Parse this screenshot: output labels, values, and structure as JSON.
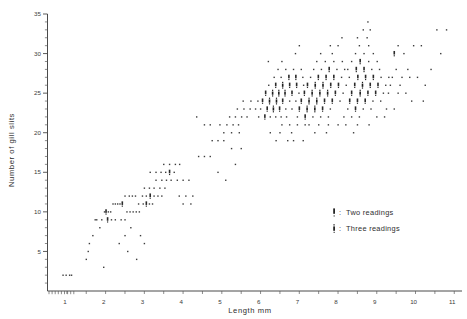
{
  "figure": {
    "background": "#ffffff",
    "ink": "#3a3a3a"
  },
  "chart_data": {
    "type": "scatter",
    "title": "",
    "xlabel": "Length  mm",
    "ylabel": "Number of gill slits",
    "xlim": [
      0.55,
      11.25
    ],
    "ylim": [
      0,
      35
    ],
    "grid": false,
    "xticks": [
      1,
      2,
      3,
      4,
      5,
      6,
      7,
      8,
      9,
      10,
      11
    ],
    "xticklabels": [
      "1",
      "2",
      "3",
      "4",
      "5",
      "6",
      "7",
      "8",
      "9",
      "10",
      "11"
    ],
    "yticks": [
      5,
      10,
      15,
      20,
      25,
      30,
      35
    ],
    "yticklabels": [
      "5",
      "10",
      "15",
      "20",
      "25",
      "30",
      "35"
    ],
    "x_minor_step": 0.5,
    "y_minor_step": 1,
    "legend": {
      "position": "inside-lower-right",
      "entries": [
        {
          "symbol": "two-readings-marker",
          "separator": ":",
          "label": "Two  readings"
        },
        {
          "symbol": "three-readings-marker",
          "separator": ":",
          "label": "Three  readings"
        }
      ]
    },
    "marker_weights": {
      "single": 1,
      "two": 2,
      "three": 3
    },
    "points": [
      [
        0.95,
        2,
        1
      ],
      [
        1.03,
        2,
        1
      ],
      [
        1.12,
        2,
        1
      ],
      [
        1.17,
        2,
        1
      ],
      [
        1.55,
        4,
        1
      ],
      [
        1.6,
        5,
        1
      ],
      [
        1.63,
        6,
        1
      ],
      [
        1.72,
        7,
        1
      ],
      [
        1.78,
        9,
        1
      ],
      [
        1.82,
        9,
        1
      ],
      [
        1.95,
        9,
        1
      ],
      [
        1.9,
        8,
        1
      ],
      [
        2.02,
        10,
        1
      ],
      [
        2.06,
        10,
        2
      ],
      [
        2.12,
        10,
        1
      ],
      [
        2.18,
        10,
        1
      ],
      [
        2.24,
        11,
        1
      ],
      [
        2.3,
        11,
        1
      ],
      [
        2.36,
        11,
        1
      ],
      [
        2.42,
        11,
        1
      ],
      [
        2.48,
        11,
        2
      ],
      [
        2.1,
        9,
        2
      ],
      [
        2.2,
        9,
        1
      ],
      [
        2.3,
        9,
        1
      ],
      [
        2.45,
        9,
        1
      ],
      [
        2.55,
        9,
        1
      ],
      [
        2.6,
        10,
        1
      ],
      [
        2.68,
        10,
        1
      ],
      [
        2.76,
        10,
        1
      ],
      [
        2.84,
        10,
        1
      ],
      [
        2.92,
        10,
        1
      ],
      [
        2.55,
        12,
        1
      ],
      [
        2.66,
        12,
        1
      ],
      [
        2.74,
        12,
        1
      ],
      [
        2.82,
        12,
        1
      ],
      [
        2.9,
        11,
        1
      ],
      [
        3.02,
        11,
        1
      ],
      [
        3.1,
        11,
        2
      ],
      [
        3.18,
        11,
        1
      ],
      [
        3.26,
        11,
        1
      ],
      [
        3.0,
        12,
        1
      ],
      [
        3.1,
        12,
        1
      ],
      [
        3.2,
        12,
        2
      ],
      [
        3.3,
        12,
        1
      ],
      [
        3.4,
        12,
        1
      ],
      [
        3.5,
        12,
        1
      ],
      [
        3.05,
        13,
        1
      ],
      [
        3.18,
        13,
        1
      ],
      [
        3.3,
        13,
        1
      ],
      [
        3.45,
        13,
        1
      ],
      [
        3.58,
        13,
        1
      ],
      [
        3.35,
        14,
        1
      ],
      [
        3.5,
        14,
        1
      ],
      [
        3.62,
        14,
        1
      ],
      [
        3.74,
        14,
        1
      ],
      [
        3.2,
        15,
        1
      ],
      [
        3.35,
        15,
        1
      ],
      [
        3.48,
        15,
        1
      ],
      [
        3.6,
        15,
        1
      ],
      [
        3.7,
        15,
        2
      ],
      [
        3.82,
        15,
        1
      ],
      [
        3.55,
        16,
        1
      ],
      [
        3.7,
        16,
        1
      ],
      [
        3.85,
        16,
        1
      ],
      [
        3.96,
        16,
        1
      ],
      [
        3.9,
        14,
        1
      ],
      [
        4.05,
        14,
        1
      ],
      [
        4.2,
        14,
        1
      ],
      [
        3.95,
        12,
        1
      ],
      [
        4.12,
        12,
        1
      ],
      [
        4.3,
        12,
        1
      ],
      [
        4.05,
        11,
        1
      ],
      [
        4.25,
        11,
        1
      ],
      [
        2.7,
        8,
        1
      ],
      [
        2.95,
        7,
        1
      ],
      [
        3.05,
        6,
        1
      ],
      [
        2.62,
        5,
        1
      ],
      [
        2.4,
        6,
        1
      ],
      [
        2.55,
        7,
        1
      ],
      [
        2.85,
        4,
        1
      ],
      [
        2.0,
        3,
        1
      ],
      [
        4.45,
        17,
        1
      ],
      [
        4.6,
        17,
        1
      ],
      [
        4.75,
        17,
        1
      ],
      [
        4.8,
        19,
        1
      ],
      [
        4.95,
        19,
        1
      ],
      [
        5.1,
        19,
        1
      ],
      [
        5.0,
        21,
        1
      ],
      [
        5.18,
        21,
        1
      ],
      [
        5.34,
        21,
        1
      ],
      [
        5.48,
        21,
        1
      ],
      [
        5.25,
        22,
        1
      ],
      [
        5.4,
        22,
        1
      ],
      [
        5.56,
        22,
        1
      ],
      [
        5.7,
        22,
        1
      ],
      [
        5.1,
        20,
        1
      ],
      [
        5.3,
        20,
        1
      ],
      [
        5.5,
        20,
        1
      ],
      [
        5.45,
        23,
        1
      ],
      [
        5.62,
        23,
        1
      ],
      [
        5.78,
        23,
        1
      ],
      [
        5.92,
        23,
        1
      ],
      [
        5.6,
        24,
        1
      ],
      [
        5.8,
        24,
        1
      ],
      [
        5.98,
        24,
        1
      ],
      [
        5.3,
        18,
        1
      ],
      [
        5.55,
        18,
        1
      ],
      [
        5.4,
        16,
        1
      ],
      [
        6.0,
        22,
        1
      ],
      [
        6.16,
        22,
        2
      ],
      [
        6.3,
        22,
        1
      ],
      [
        6.44,
        22,
        1
      ],
      [
        6.58,
        22,
        1
      ],
      [
        6.72,
        22,
        1
      ],
      [
        6.05,
        23,
        1
      ],
      [
        6.22,
        23,
        2
      ],
      [
        6.38,
        23,
        3
      ],
      [
        6.54,
        23,
        2
      ],
      [
        6.7,
        23,
        1
      ],
      [
        6.86,
        23,
        1
      ],
      [
        6.1,
        24,
        2
      ],
      [
        6.28,
        24,
        3
      ],
      [
        6.46,
        24,
        3
      ],
      [
        6.62,
        24,
        2
      ],
      [
        6.8,
        24,
        1
      ],
      [
        6.96,
        24,
        1
      ],
      [
        6.18,
        25,
        2
      ],
      [
        6.36,
        25,
        3
      ],
      [
        6.52,
        25,
        3
      ],
      [
        6.68,
        25,
        3
      ],
      [
        6.86,
        25,
        2
      ],
      [
        7.04,
        25,
        1
      ],
      [
        6.26,
        26,
        1
      ],
      [
        6.44,
        26,
        2
      ],
      [
        6.62,
        26,
        3
      ],
      [
        6.8,
        26,
        2
      ],
      [
        6.98,
        26,
        2
      ],
      [
        7.16,
        26,
        1
      ],
      [
        6.4,
        27,
        1
      ],
      [
        6.58,
        27,
        1
      ],
      [
        6.78,
        27,
        2
      ],
      [
        6.96,
        27,
        2
      ],
      [
        7.14,
        27,
        1
      ],
      [
        6.5,
        28,
        1
      ],
      [
        6.7,
        28,
        1
      ],
      [
        6.9,
        28,
        1
      ],
      [
        7.1,
        28,
        1
      ],
      [
        6.6,
        21,
        1
      ],
      [
        6.8,
        21,
        1
      ],
      [
        7.0,
        21,
        1
      ],
      [
        7.2,
        21,
        1
      ],
      [
        6.3,
        20,
        1
      ],
      [
        6.55,
        20,
        1
      ],
      [
        6.85,
        20,
        1
      ],
      [
        6.45,
        19,
        1
      ],
      [
        6.9,
        19,
        1
      ],
      [
        6.25,
        29,
        1
      ],
      [
        6.6,
        29,
        1
      ],
      [
        7.0,
        22,
        1
      ],
      [
        7.2,
        22,
        2
      ],
      [
        7.4,
        22,
        1
      ],
      [
        7.6,
        22,
        1
      ],
      [
        7.8,
        22,
        1
      ],
      [
        7.05,
        23,
        2
      ],
      [
        7.25,
        23,
        3
      ],
      [
        7.45,
        23,
        3
      ],
      [
        7.65,
        23,
        2
      ],
      [
        7.85,
        23,
        1
      ],
      [
        7.1,
        24,
        2
      ],
      [
        7.3,
        24,
        3
      ],
      [
        7.5,
        24,
        3
      ],
      [
        7.7,
        24,
        2
      ],
      [
        7.9,
        24,
        2
      ],
      [
        8.1,
        24,
        1
      ],
      [
        7.18,
        25,
        2
      ],
      [
        7.38,
        25,
        3
      ],
      [
        7.58,
        25,
        3
      ],
      [
        7.78,
        25,
        3
      ],
      [
        7.98,
        25,
        2
      ],
      [
        8.18,
        25,
        1
      ],
      [
        7.26,
        26,
        2
      ],
      [
        7.46,
        26,
        3
      ],
      [
        7.66,
        26,
        3
      ],
      [
        7.86,
        26,
        2
      ],
      [
        8.06,
        26,
        2
      ],
      [
        8.26,
        26,
        1
      ],
      [
        7.34,
        27,
        1
      ],
      [
        7.54,
        27,
        2
      ],
      [
        7.74,
        27,
        2
      ],
      [
        7.94,
        27,
        2
      ],
      [
        8.14,
        27,
        1
      ],
      [
        8.34,
        27,
        1
      ],
      [
        7.42,
        28,
        1
      ],
      [
        7.62,
        28,
        1
      ],
      [
        7.82,
        28,
        2
      ],
      [
        8.02,
        28,
        1
      ],
      [
        8.22,
        28,
        1
      ],
      [
        7.5,
        29,
        1
      ],
      [
        7.72,
        29,
        1
      ],
      [
        7.94,
        29,
        1
      ],
      [
        8.16,
        29,
        1
      ],
      [
        7.3,
        21,
        1
      ],
      [
        7.55,
        21,
        1
      ],
      [
        7.8,
        21,
        1
      ],
      [
        8.05,
        21,
        1
      ],
      [
        7.45,
        20,
        1
      ],
      [
        7.75,
        20,
        1
      ],
      [
        7.6,
        30,
        1
      ],
      [
        7.9,
        30,
        1
      ],
      [
        8.2,
        22,
        1
      ],
      [
        8.4,
        22,
        1
      ],
      [
        8.6,
        22,
        1
      ],
      [
        8.3,
        23,
        1
      ],
      [
        8.5,
        23,
        2
      ],
      [
        8.7,
        23,
        1
      ],
      [
        8.9,
        23,
        1
      ],
      [
        8.35,
        24,
        2
      ],
      [
        8.55,
        24,
        2
      ],
      [
        8.75,
        24,
        2
      ],
      [
        8.95,
        24,
        1
      ],
      [
        9.15,
        24,
        1
      ],
      [
        8.4,
        25,
        2
      ],
      [
        8.62,
        25,
        3
      ],
      [
        8.82,
        25,
        2
      ],
      [
        9.02,
        25,
        2
      ],
      [
        9.22,
        25,
        1
      ],
      [
        8.48,
        26,
        2
      ],
      [
        8.68,
        26,
        3
      ],
      [
        8.88,
        26,
        2
      ],
      [
        9.08,
        26,
        2
      ],
      [
        9.28,
        26,
        1
      ],
      [
        8.56,
        27,
        2
      ],
      [
        8.76,
        27,
        2
      ],
      [
        8.96,
        27,
        2
      ],
      [
        9.16,
        27,
        1
      ],
      [
        9.36,
        27,
        1
      ],
      [
        8.3,
        28,
        1
      ],
      [
        8.52,
        28,
        2
      ],
      [
        8.72,
        28,
        2
      ],
      [
        8.92,
        28,
        1
      ],
      [
        9.12,
        28,
        1
      ],
      [
        8.4,
        29,
        1
      ],
      [
        8.62,
        29,
        2
      ],
      [
        8.84,
        29,
        1
      ],
      [
        9.06,
        29,
        1
      ],
      [
        8.5,
        30,
        1
      ],
      [
        8.72,
        30,
        1
      ],
      [
        8.96,
        30,
        1
      ],
      [
        8.6,
        31,
        1
      ],
      [
        8.84,
        31,
        1
      ],
      [
        8.55,
        32,
        1
      ],
      [
        8.8,
        32,
        1
      ],
      [
        8.7,
        33,
        1
      ],
      [
        8.88,
        33,
        1
      ],
      [
        8.82,
        34,
        1
      ],
      [
        8.25,
        21,
        1
      ],
      [
        8.55,
        21,
        1
      ],
      [
        8.85,
        21,
        1
      ],
      [
        8.45,
        20,
        1
      ],
      [
        9.3,
        23,
        1
      ],
      [
        9.5,
        23,
        1
      ],
      [
        9.35,
        25,
        1
      ],
      [
        9.6,
        25,
        1
      ],
      [
        9.8,
        25,
        1
      ],
      [
        9.4,
        26,
        1
      ],
      [
        9.65,
        26,
        1
      ],
      [
        9.45,
        27,
        1
      ],
      [
        9.7,
        27,
        1
      ],
      [
        9.55,
        28,
        1
      ],
      [
        9.85,
        28,
        1
      ],
      [
        9.5,
        30,
        2
      ],
      [
        9.75,
        30,
        1
      ],
      [
        9.6,
        31,
        1
      ],
      [
        9.9,
        27,
        1
      ],
      [
        10.1,
        27,
        1
      ],
      [
        10.0,
        31,
        1
      ],
      [
        10.2,
        31,
        1
      ],
      [
        10.3,
        26,
        1
      ],
      [
        10.6,
        33,
        1
      ],
      [
        10.85,
        33,
        1
      ],
      [
        10.7,
        30,
        1
      ],
      [
        9.95,
        24,
        1
      ],
      [
        10.25,
        24,
        1
      ],
      [
        10.45,
        28,
        1
      ],
      [
        4.95,
        15,
        1
      ],
      [
        5.15,
        14,
        1
      ],
      [
        4.6,
        21,
        1
      ],
      [
        4.75,
        21,
        1
      ],
      [
        4.4,
        22,
        1
      ],
      [
        6.95,
        30,
        1
      ],
      [
        7.05,
        31,
        1
      ],
      [
        7.85,
        31,
        1
      ],
      [
        8.05,
        31,
        1
      ],
      [
        8.15,
        32,
        1
      ],
      [
        6.75,
        19,
        1
      ],
      [
        7.15,
        19,
        1
      ],
      [
        9.05,
        22,
        1
      ],
      [
        9.25,
        22,
        1
      ]
    ]
  }
}
